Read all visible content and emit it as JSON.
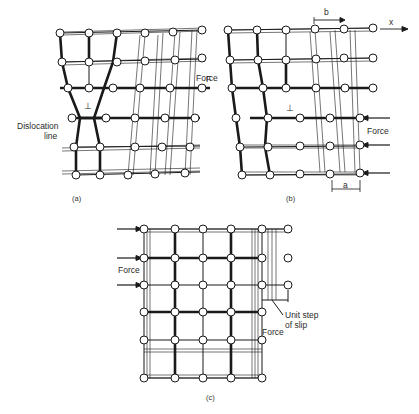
{
  "figure": {
    "panels": [
      {
        "id": "a",
        "caption": "(a)",
        "labels": {
          "dislocation": "Dislocation\nline",
          "dislocation_line1": "Dislocation",
          "dislocation_line2": "line",
          "force_partial": "F",
          "dislocation_symbol": "⊥"
        }
      },
      {
        "id": "b",
        "caption": "(b)",
        "labels": {
          "burgers_vector": "b",
          "x_axis": "x",
          "force_left": "Force",
          "force_right": "Force",
          "spacing": "a",
          "dislocation_symbol": "⊥"
        }
      },
      {
        "id": "c",
        "caption": "(c)",
        "labels": {
          "force_left": "Force",
          "force_right": "Force",
          "unit_step_line1": "Unit step",
          "unit_step_line2": "of slip"
        }
      }
    ],
    "colors": {
      "ink": "#1a1a1a",
      "atom_fill": "#ffffff",
      "background": "#ffffff"
    }
  }
}
